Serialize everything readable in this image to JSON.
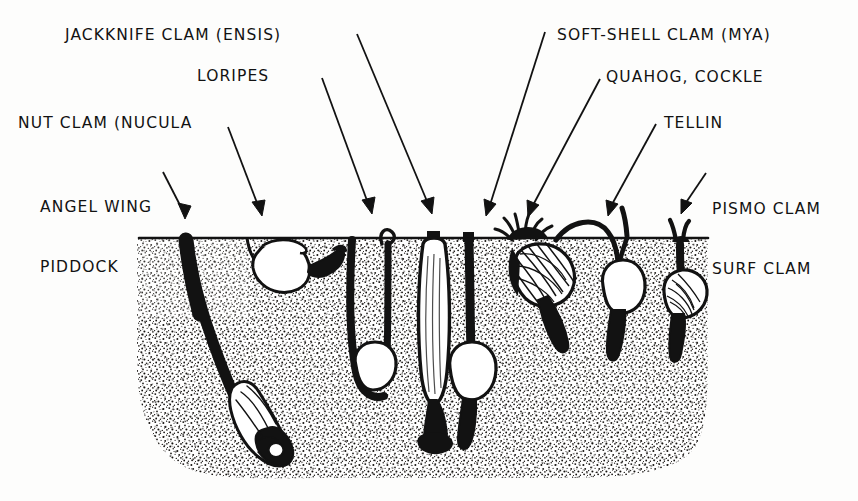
{
  "figure": {
    "kind": "scientific-illustration",
    "style": "pen-and-ink hand-lettered stipple drawing",
    "ink_color": "#121212",
    "paper_color": "#fdfdfc"
  },
  "labels": [
    {
      "id": "jackknife",
      "text": "JACKKNIFE CLAM (ENSIS)",
      "lines": [
        "JACKKNIFE CLAM (ENSIS)"
      ],
      "side": "left"
    },
    {
      "id": "loripes",
      "text": "LORIPES",
      "lines": [
        "LORIPES"
      ],
      "side": "left"
    },
    {
      "id": "nut-clam",
      "text": "NUT CLAM (NUCULA",
      "lines": [
        "NUT CLAM (NUCULA"
      ],
      "side": "left"
    },
    {
      "id": "angel-wing",
      "text": "ANGEL WING PIDDOCK",
      "lines": [
        "ANGEL WING",
        "PIDDOCK"
      ],
      "side": "left"
    },
    {
      "id": "soft-shell",
      "text": "SOFT-SHELL CLAM (MYA)",
      "lines": [
        "SOFT-SHELL CLAM (MYA)"
      ],
      "side": "right"
    },
    {
      "id": "quahog",
      "text": "QUAHOG, COCKLE",
      "lines": [
        "QUAHOG, COCKLE"
      ],
      "side": "right"
    },
    {
      "id": "tellin",
      "text": "TELLIN",
      "lines": [
        "TELLIN"
      ],
      "side": "right"
    },
    {
      "id": "pismo",
      "text": "PISMO CLAM SURF CLAM",
      "lines": [
        "PISMO CLAM",
        "SURF CLAM"
      ],
      "side": "right"
    }
  ],
  "label_lines": {
    "jackknife_1": "JACKKNIFE CLAM (ENSIS)",
    "loripes_1": "LORIPES",
    "nutclam_1": "NUT CLAM (NUCULA",
    "angelwing_1": "ANGEL WING",
    "angelwing_2": "PIDDOCK",
    "softshell_1": "SOFT-SHELL CLAM (MYA)",
    "quahog_1": "QUAHOG, COCKLE",
    "tellin_1": "TELLIN",
    "pismo_1": "PISMO CLAM",
    "pismo_2": "SURF CLAM"
  },
  "arrows": [
    {
      "id": "arrow-angel-wing",
      "from": [
        163,
        172
      ],
      "to": [
        185,
        219
      ],
      "points_to": "angel-wing-piddock-burrow"
    },
    {
      "id": "arrow-nut-clam",
      "from": [
        228,
        127
      ],
      "to": [
        262,
        216
      ],
      "points_to": "nucula-at-surface"
    },
    {
      "id": "arrow-loripes",
      "from": [
        322,
        78
      ],
      "to": [
        372,
        214
      ],
      "points_to": "loripes-burrow"
    },
    {
      "id": "arrow-jackknife",
      "from": [
        357,
        34
      ],
      "to": [
        432,
        214
      ],
      "points_to": "ensis-vertical-burrow"
    },
    {
      "id": "arrow-soft-shell",
      "from": [
        545,
        32
      ],
      "to": [
        486,
        216
      ],
      "points_to": "mya-deep-siphon"
    },
    {
      "id": "arrow-quahog",
      "from": [
        600,
        79
      ],
      "to": [
        528,
        217
      ],
      "points_to": "cockle-shallow"
    },
    {
      "id": "arrow-tellin",
      "from": [
        656,
        124
      ],
      "to": [
        608,
        216
      ],
      "points_to": "tellin-burrow"
    },
    {
      "id": "arrow-pismo",
      "from": [
        706,
        173
      ],
      "to": [
        681,
        214
      ],
      "points_to": "pismo-surf-clam"
    }
  ],
  "sediment_block": {
    "name": "sediment-cross-section",
    "surface_y": 238,
    "bottom_y": 478,
    "left_x": 137,
    "right_x": 708,
    "texture": "stipple"
  },
  "organisms": [
    {
      "id": "angel-wing-piddock-burrow",
      "common_name": "Angel Wing / Piddock",
      "depth": "deep",
      "position": "long oblique burrow to deep sediment"
    },
    {
      "id": "nucula-at-surface",
      "common_name": "Nut Clam (Nucula)",
      "depth": "surface",
      "position": "at sediment surface"
    },
    {
      "id": "loripes-burrow",
      "common_name": "Loripes",
      "depth": "medium",
      "position": "narrow vertical burrow with rounded shell"
    },
    {
      "id": "ensis-vertical-burrow",
      "common_name": "Jackknife Clam (Ensis)",
      "depth": "deep",
      "position": "elongate vertical razor shell"
    },
    {
      "id": "mya-deep-siphon",
      "common_name": "Soft-shell Clam (Mya)",
      "depth": "deep",
      "position": "deep with long siphon to surface"
    },
    {
      "id": "cockle-shallow",
      "common_name": "Quahog / Cockle",
      "depth": "shallow",
      "position": "just below surface with short siphons"
    },
    {
      "id": "tellin-burrow",
      "common_name": "Tellin",
      "depth": "medium",
      "position": "shell with long inhalant siphon"
    },
    {
      "id": "pismo-surf-clam",
      "common_name": "Pismo Clam / Surf Clam",
      "depth": "shallow",
      "position": "shallow with short siphons"
    }
  ]
}
